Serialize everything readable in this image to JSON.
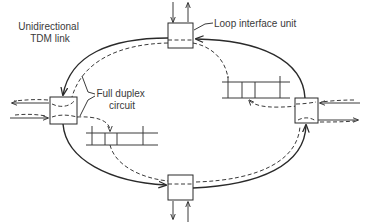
{
  "labels": {
    "tdm_link": [
      "Unidirectional",
      "TDM link"
    ],
    "loop_interface_unit": "Loop interface unit",
    "full_duplex_circuit": [
      "Full duplex",
      "circuit"
    ]
  },
  "nodes": [
    {
      "id": "top",
      "name": "loop-interface-unit-top"
    },
    {
      "id": "left",
      "name": "loop-interface-unit-left"
    },
    {
      "id": "right",
      "name": "loop-interface-unit-right"
    },
    {
      "id": "bottom",
      "name": "loop-interface-unit-bottom"
    }
  ],
  "slot_frames": [
    {
      "id": "upper",
      "slots": 4
    },
    {
      "id": "lower",
      "slots": 4
    }
  ],
  "colors": {
    "line": "#2a2a2a",
    "text": "#3a3a3a",
    "background": "#ffffff"
  }
}
